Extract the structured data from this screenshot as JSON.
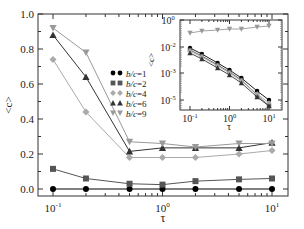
{
  "chart_data": {
    "type": "line",
    "title": "",
    "xlabel": "τ",
    "ylabel": "<c>",
    "xscale": "log",
    "xlim": [
      0.085,
      12
    ],
    "ylim": [
      -0.05,
      1.0
    ],
    "x": [
      0.1,
      0.2,
      0.5,
      1,
      2,
      5,
      10
    ],
    "x_ticks": [
      {
        "value": 0.1,
        "base": "10",
        "exp": "-1"
      },
      {
        "value": 1,
        "base": "10",
        "exp": "0"
      },
      {
        "value": 10,
        "base": "10",
        "exp": "1"
      }
    ],
    "y_ticks": [
      "0.0",
      "0.2",
      "0.4",
      "0.6",
      "0.8",
      "1.0"
    ],
    "grid": false,
    "legend_position": "upper-center",
    "series": [
      {
        "name": "b/c=1",
        "marker": "circle",
        "color": "#000000",
        "values": [
          0.0,
          0.0,
          0.0,
          0.0,
          0.0,
          0.0,
          0.0
        ]
      },
      {
        "name": "b/c=2",
        "marker": "square",
        "color": "#555555",
        "values": [
          0.115,
          0.06,
          0.03,
          0.025,
          0.045,
          0.055,
          0.06
        ]
      },
      {
        "name": "b/c=4",
        "marker": "diamond",
        "color": "#aaaaaa",
        "values": [
          0.74,
          0.44,
          0.18,
          0.18,
          0.18,
          0.2,
          0.22
        ]
      },
      {
        "name": "b/c=6",
        "marker": "triangle-up",
        "color": "#333333",
        "values": [
          0.88,
          0.64,
          0.215,
          0.235,
          0.235,
          0.235,
          0.265
        ]
      },
      {
        "name": "b/c=9",
        "marker": "triangle-down",
        "color": "#999999",
        "values": [
          0.92,
          0.78,
          0.27,
          0.26,
          0.24,
          0.26,
          0.26
        ]
      }
    ],
    "inset": {
      "type": "line",
      "xlabel": "τ",
      "ylabel": "<c>",
      "xscale": "log",
      "yscale": "log",
      "x": [
        0.1,
        0.2,
        0.5,
        1,
        2,
        5,
        10
      ],
      "x_ticks": [
        {
          "value": 0.1,
          "base": "10",
          "exp": "-1"
        },
        {
          "value": 1,
          "base": "10",
          "exp": "0"
        },
        {
          "value": 10,
          "base": "10",
          "exp": "1"
        }
      ],
      "y_ticks": [
        {
          "pos": 0,
          "base": "10",
          "exp": "0"
        },
        {
          "pos": 1,
          "base": "10",
          "exp": "-2"
        },
        {
          "pos": 2,
          "base": "10",
          "exp": "-3"
        },
        {
          "pos": 3,
          "base": "10",
          "exp": "-5"
        }
      ],
      "series_pixel_y": [
        {
          "name": "b/c=1",
          "marker": "circle",
          "color": "#000000",
          "values": [
            48,
            54,
            63,
            70,
            78,
            91,
            100
          ]
        },
        {
          "name": "b/c=2",
          "marker": "square",
          "color": "#555555",
          "values": [
            50,
            56,
            65,
            72,
            80,
            95,
            106
          ]
        },
        {
          "name": "b/c=4",
          "marker": "diamond",
          "color": "#aaaaaa",
          "values": [
            51,
            57,
            66,
            73,
            81,
            94,
            103
          ]
        },
        {
          "name": "b/c=6",
          "marker": "triangle-up",
          "color": "#333333",
          "values": [
            53,
            59,
            68,
            75,
            83,
            97,
            106
          ]
        },
        {
          "name": "b/c=9",
          "marker": "triangle-down",
          "color": "#999999",
          "values": [
            33,
            31,
            30,
            29,
            29,
            27,
            26
          ]
        }
      ]
    }
  }
}
